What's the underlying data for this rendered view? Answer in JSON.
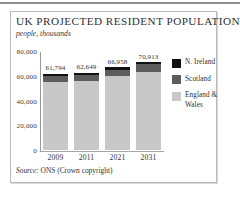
{
  "figure": {
    "title": "UK PROJECTED RESIDENT POPULATION",
    "subtitle": "people, thousands",
    "source_label": "Source:",
    "source_text": "ONS (Crown copyright)"
  },
  "colors": {
    "n_ireland": "#111111",
    "scotland": "#5d5d5d",
    "england_wales": "#c8c8c8",
    "frame": "#b9b9b9",
    "axis": "#9a9a9a"
  },
  "chart_data": {
    "type": "bar",
    "title": "UK PROJECTED RESIDENT POPULATION",
    "subtitle": "people, thousands",
    "stacked": true,
    "xlabel": "",
    "ylabel": "people, thousands",
    "ylim": [
      0,
      80000
    ],
    "yticks": [
      0,
      20000,
      40000,
      60000,
      80000
    ],
    "ytick_labels": [
      "0",
      "20,000",
      "40,000",
      "60,000",
      "80,000"
    ],
    "grid": false,
    "legend_position": "right",
    "categories": [
      "2009",
      "2011",
      "2021",
      "2031"
    ],
    "series": [
      {
        "name": "England & Wales",
        "color": "#c8c8c8",
        "values": [
          54717,
          55477,
          59529,
          63307
        ]
      },
      {
        "name": "Scotland",
        "color": "#5d5d5d",
        "values": [
          5194,
          5254,
          5537,
          5829
        ]
      },
      {
        "name": "N. Ireland",
        "color": "#111111",
        "values": [
          1883,
          1918,
          1892,
          1777
        ]
      }
    ],
    "totals": [
      61794,
      62649,
      66958,
      70913
    ],
    "total_labels": [
      "61,794",
      "62,649",
      "66,958",
      "70,913"
    ],
    "legend": [
      {
        "label": "N. Ireland",
        "color": "#111111"
      },
      {
        "label": "Scotland",
        "color": "#5d5d5d"
      },
      {
        "label": "England & Wales",
        "color": "#c8c8c8"
      }
    ],
    "source": "Source: ONS (Crown copyright)"
  }
}
